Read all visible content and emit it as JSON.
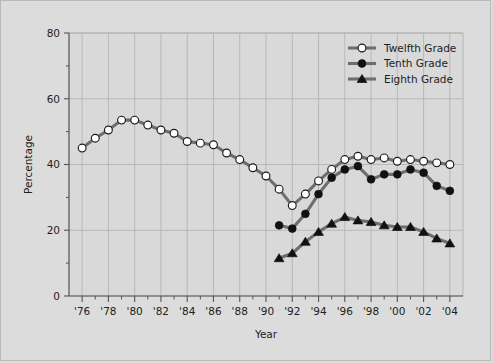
{
  "figure": {
    "background_color": "#dcdcdc",
    "plot_background_color": "#d9d9d9",
    "grid_color": "#b0b0b0",
    "axis_color": "#555555",
    "line_color": "#6e6e6e",
    "marker_fill_open": "#ffffff",
    "marker_fill_solid": "#111111",
    "text_color": "#1d1d1d"
  },
  "chart_data": {
    "type": "line",
    "title": "",
    "xlabel": "Year",
    "ylabel": "Percentage",
    "xlim": [
      1975,
      2005
    ],
    "ylim": [
      0,
      80
    ],
    "yticks": [
      0,
      20,
      40,
      60,
      80
    ],
    "ytick_labels": [
      "0",
      "20",
      "40",
      "60",
      "80"
    ],
    "yminor_ticks": [
      10,
      30,
      50,
      70
    ],
    "xticks": [
      1976,
      1978,
      1980,
      1982,
      1984,
      1986,
      1988,
      1990,
      1992,
      1994,
      1996,
      1998,
      2000,
      2002,
      2004
    ],
    "xtick_labels": [
      "'76",
      "'78",
      "'80",
      "'82",
      "'84",
      "'86",
      "'88",
      "'90",
      "'92",
      "'94",
      "'96",
      "'98",
      "'00",
      "'02",
      "'04"
    ],
    "xminor_ticks": [
      1977,
      1979,
      1981,
      1983,
      1985,
      1987,
      1989,
      1991,
      1993,
      1995,
      1997,
      1999,
      2001,
      2003
    ],
    "grid": true,
    "grid_axis": "both",
    "legend_position": "top-right",
    "series": [
      {
        "name": "Twelfth Grade",
        "marker": "open-circle",
        "x": [
          1976,
          1977,
          1978,
          1979,
          1980,
          1981,
          1982,
          1983,
          1984,
          1985,
          1986,
          1987,
          1988,
          1989,
          1990,
          1991,
          1992,
          1993,
          1994,
          1995,
          1996,
          1997,
          1998,
          1999,
          2000,
          2001,
          2002,
          2003,
          2004
        ],
        "values": [
          45.0,
          48.0,
          50.5,
          53.5,
          53.5,
          52.0,
          50.5,
          49.5,
          47.0,
          46.5,
          46.0,
          43.5,
          41.5,
          39.0,
          36.5,
          32.5,
          27.5,
          31.0,
          35.0,
          38.5,
          41.5,
          42.5,
          41.5,
          42.0,
          41.0,
          41.5,
          41.0,
          40.5,
          40.0
        ]
      },
      {
        "name": "Tenth Grade",
        "marker": "filled-circle",
        "x": [
          1991,
          1992,
          1993,
          1994,
          1995,
          1996,
          1997,
          1998,
          1999,
          2000,
          2001,
          2002,
          2003,
          2004
        ],
        "values": [
          21.5,
          20.5,
          25.0,
          31.0,
          36.0,
          38.5,
          39.5,
          35.5,
          37.0,
          37.0,
          38.5,
          37.5,
          33.5,
          32.0
        ]
      },
      {
        "name": "Eighth Grade",
        "marker": "filled-triangle",
        "x": [
          1991,
          1992,
          1993,
          1994,
          1995,
          1996,
          1997,
          1998,
          1999,
          2000,
          2001,
          2002,
          2003,
          2004
        ],
        "values": [
          11.5,
          13.0,
          16.5,
          19.5,
          22.0,
          24.0,
          23.0,
          22.5,
          21.5,
          21.0,
          21.0,
          19.5,
          17.5,
          16.0
        ]
      }
    ]
  },
  "legend": {
    "items": [
      {
        "label": "Twelfth Grade",
        "marker": "open-circle"
      },
      {
        "label": "Tenth Grade",
        "marker": "filled-circle"
      },
      {
        "label": "Eighth Grade",
        "marker": "filled-triangle"
      }
    ]
  }
}
